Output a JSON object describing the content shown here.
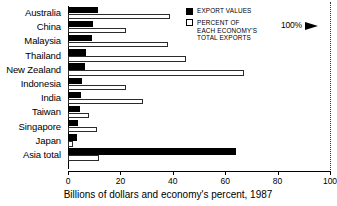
{
  "chart_data": {
    "type": "bar",
    "orientation": "horizontal",
    "title": "",
    "xlabel": "Billions of dollars and economy's percent, 1987",
    "ylabel": "",
    "xlim": [
      0,
      100
    ],
    "xticks": [
      0,
      20,
      40,
      60,
      80,
      100
    ],
    "xticklabels": [
      "0",
      "20",
      "40",
      "60",
      "80",
      "100"
    ],
    "grid": false,
    "legend_position": "top-right",
    "categories": [
      "Australia",
      "China",
      "Malaysia",
      "Thailand",
      "New Zealand",
      "Indonesia",
      "India",
      "Taiwan",
      "Singapore",
      "Japan",
      "Asia total"
    ],
    "series": [
      {
        "name": "EXPORT VALUES",
        "style": "filled-black",
        "unit": "billions of dollars",
        "values": [
          11.5,
          9.5,
          9.0,
          7.0,
          6.5,
          5.5,
          5.0,
          4.5,
          4.0,
          3.5,
          64.0
        ]
      },
      {
        "name": "PERCENT OF EACH ECONOMY'S TOTAL EXPORTS",
        "style": "open-white",
        "unit": "percent",
        "values": [
          39.0,
          22.0,
          38.0,
          45.0,
          67.0,
          22.0,
          28.5,
          8.0,
          11.0,
          2.0,
          12.0
        ]
      }
    ],
    "annotations": [
      {
        "label": "100%",
        "value": 100,
        "marker": "arrow-to-dotted-line"
      }
    ]
  },
  "legend": {
    "items": [
      {
        "swatch": "filled",
        "lines": [
          "EXPORT VALUES"
        ]
      },
      {
        "swatch": "open",
        "lines": [
          "PERCENT OF",
          "EACH ECONOMY'S",
          "TOTAL EXPORTS"
        ]
      }
    ]
  },
  "reference": {
    "label": "100%"
  }
}
